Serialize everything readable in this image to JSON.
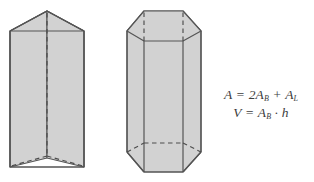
{
  "figure": {
    "background_color": "#ffffff",
    "face_fill_color": "#d2d2d2",
    "edge_color": "#555555",
    "hidden_edge_color": "#4d4d4d",
    "text_color": "#3c3c3c",
    "shapes": [
      {
        "name": "triangular-prism",
        "label": "Triangular prism",
        "base_sides": 3
      },
      {
        "name": "hexagonal-prism",
        "label": "Hexagonal prism",
        "base_sides": 6
      }
    ]
  },
  "formulas": {
    "surface_area": {
      "name": "surface-area-formula",
      "plain": "A = 2A_B + A_L",
      "lhs": "A",
      "equals": " = ",
      "term1_coefficient": "2",
      "term1_symbol": "A",
      "term1_subscript": "B",
      "plus": " + ",
      "term2_symbol": "A",
      "term2_subscript": "L"
    },
    "volume": {
      "name": "volume-formula",
      "plain": "V = A_B · h",
      "lhs": "V",
      "equals": " = ",
      "term1_symbol": "A",
      "term1_subscript": "B",
      "dot": " · ",
      "term2_symbol": "h"
    }
  }
}
